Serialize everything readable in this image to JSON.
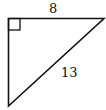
{
  "diagram": {
    "type": "right-triangle",
    "stroke_color": "#111111",
    "background": "#ffffff",
    "vertices": {
      "right_angle": [
        8,
        18
      ],
      "top_right": [
        104,
        18
      ],
      "bottom_left": [
        8,
        106
      ]
    },
    "right_angle_marker": true,
    "labels": {
      "top_side": "8",
      "hypotenuse": "13"
    }
  }
}
